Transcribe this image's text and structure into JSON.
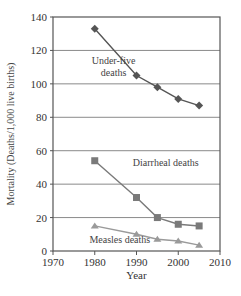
{
  "chart_data": {
    "type": "line",
    "title": "",
    "xlabel": "Year",
    "ylabel": "Mortality (Deaths/1,000 live births)",
    "xlim": [
      1970,
      2010
    ],
    "ylim": [
      0,
      140
    ],
    "xticks": [
      1970,
      1980,
      1990,
      2000,
      2010
    ],
    "yticks": [
      0,
      20,
      40,
      60,
      80,
      100,
      120,
      140
    ],
    "grid": "horizontal",
    "legend": "inline annotations",
    "series": [
      {
        "name": "Under-five deaths",
        "marker": "diamond",
        "color": "#555555",
        "x": [
          1980,
          1990,
          1995,
          2000,
          2005
        ],
        "values": [
          133,
          105,
          98,
          91,
          87
        ]
      },
      {
        "name": "Diarrheal deaths",
        "marker": "square",
        "color": "#7a7a7a",
        "x": [
          1980,
          1990,
          1995,
          2000,
          2005
        ],
        "values": [
          54,
          32,
          20,
          16,
          15
        ]
      },
      {
        "name": "Measles deaths",
        "marker": "triangle",
        "color": "#9a9a9a",
        "x": [
          1980,
          1990,
          1995,
          2000,
          2005
        ],
        "values": [
          15,
          10,
          7,
          6,
          3.5
        ]
      }
    ],
    "annotations": [
      {
        "text": [
          "Under-five",
          "deaths"
        ],
        "x": 1984.5,
        "y": 112
      },
      {
        "text": [
          "Diarrheal deaths"
        ],
        "x": 1997,
        "y": 51
      },
      {
        "text": [
          "Measles deaths"
        ],
        "x": 1986,
        "y": 5
      }
    ]
  }
}
